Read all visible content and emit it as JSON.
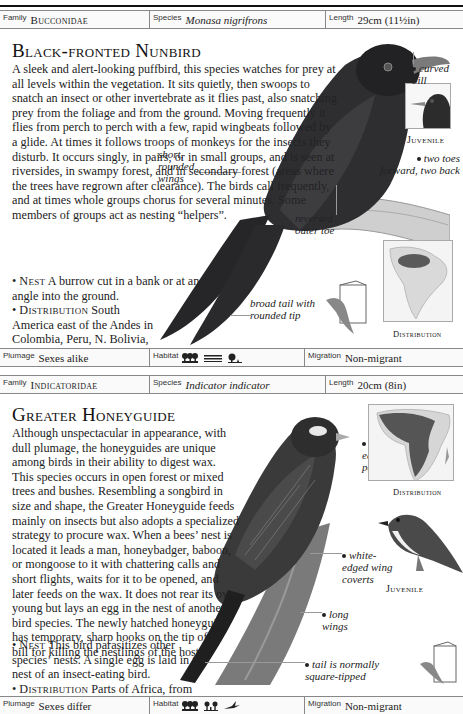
{
  "running_head": {
    "text": "Non-passerines"
  },
  "entries": [
    {
      "family_label": "Family",
      "family": "Bucconidae",
      "species_label": "Species",
      "species": "Monasa nigrifrons",
      "length_label": "Length",
      "length": "29cm (11½in)",
      "title": "Black-fronted Nunbird",
      "description": "A sleek and alert-looking puffbird, this species watches for prey at all levels within the vegetation. It sits quietly, then swoops to snatch an insect or other invertebrate as it flies past, also snatching prey from the foliage and from the ground. Moving frequently it flies from perch to perch with a few, rapid wingbeats followed by a glide. At times it follows troops of monkeys for the insects they disturb. It occurs singly, in pairs, or in small groups, and is seen at riversides, in swampy forest, and in secondary forest (areas where the trees have regrown after clearance). The birds call frequently, and at times whole groups chorus for several minutes. Some members of groups act as nesting “helpers”.",
      "nest_label": "Nest",
      "nest": "A burrow cut in a bank or at an angle into the ground.",
      "distribution_label": "Distribution",
      "distribution": "South America east of the Andes in Colombia, Peru, N. Bolivia, and Brazil.",
      "annotations": {
        "curved_bill": "curved bill",
        "juvenile": "Juvenile",
        "toes": "two toes forward, two back",
        "wings": "short, rounded wings",
        "outer_toe": "reversed outer toe",
        "tail": "broad tail with rounded tip",
        "map_label": "Distribution"
      },
      "plumage_label": "Plumage",
      "plumage": "Sexes alike",
      "habitat_label": "Habitat",
      "habitat_icons": [
        "rainforest-icon",
        "wetland-icon",
        "scrub-icon"
      ],
      "migration_label": "Migration",
      "migration": "Non-migrant",
      "colors": {
        "bird": "#2b2b2d",
        "range": "#5a5a5a",
        "land": "#d9d9d9"
      }
    },
    {
      "family_label": "Family",
      "family": "Indicatoridae",
      "species_label": "Species",
      "species": "Indicator indicator",
      "length_label": "Length",
      "length": "20cm (8in)",
      "title": "Greater Honeyguide",
      "description": "Although unspectacular in appearance, with dull plumage, the honeyguides are unique among birds in their ability to digest wax. This species occurs in open forest or mixed trees and bushes. Resembling a songbird in size and shape, the Greater Honeyguide feeds mainly on insects but also adopts a specialized strategy to procure wax. When a bees’ nest is located it leads a man, honeybadger, baboon, or mongoose to it with chattering calls and short flights, waits for it to be opened, and later feeds on the wax. It does not rear its own young but lays an egg in the nest of another bird species. The newly hatched honeyguide has temporary, sharp hooks on the tip of its bill for killing the nestlings of the host.",
      "nest_label": "Nest",
      "nest": "This bird parasitizes other species’ nests. A single egg is laid in the nest of an insect-eating bird.",
      "distribution_label": "Distribution",
      "distribution": "Parts of Africa, from Senegal to the Cape.",
      "annotations": {
        "ear_patch": "white ear patch",
        "map_label": "Distribution",
        "coverts": "white-edged wing coverts",
        "juvenile": "Juvenile",
        "long_wings": "long wings",
        "tail": "tail is normally square-tipped"
      },
      "plumage_label": "Plumage",
      "plumage": "Sexes differ",
      "habitat_label": "Habitat",
      "habitat_icons": [
        "woodland-icon",
        "open-woodland-icon",
        "aerial-icon"
      ],
      "migration_label": "Migration",
      "migration": "Non-migrant",
      "colors": {
        "bird": "#3a3a3a",
        "range": "#555555",
        "land": "#d6d6d6"
      }
    }
  ]
}
